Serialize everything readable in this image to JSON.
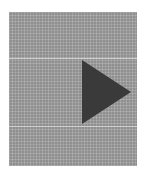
{
  "player": {
    "icon": "play-icon",
    "colors": {
      "panel": "#8f8f8f",
      "icon": "#3a3a3a",
      "line": "#cfcfcf",
      "background": "#ffffff"
    }
  }
}
